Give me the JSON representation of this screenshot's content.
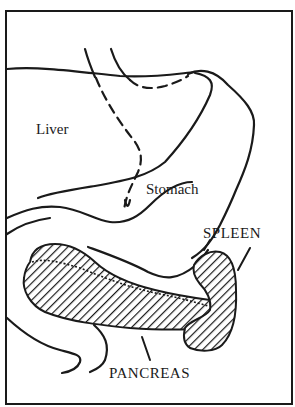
{
  "figure": {
    "type": "anatomical-line-drawing",
    "labels": {
      "liver": "Liver",
      "stomach": "Stomach",
      "spleen": "SPLEEN",
      "pancreas": "PANCREAS"
    },
    "highlighted_structures": [
      "SPLEEN",
      "PANCREAS"
    ],
    "highlight_style": "diagonal hatching",
    "colors": {
      "ink": "#1a1a1a",
      "background": "#ffffff"
    }
  }
}
